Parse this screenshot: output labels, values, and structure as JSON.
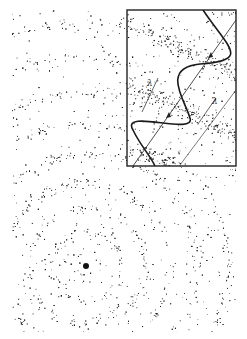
{
  "figure": {
    "background_color": "#ffffff",
    "ink_color": "#1a1a1a",
    "source": {
      "cx": 86,
      "cy": 266,
      "label": ""
    },
    "ring_radii": [
      12,
      34,
      58,
      84,
      112,
      142,
      174,
      208,
      244,
      282
    ],
    "inset": {
      "x": 127,
      "y": 10,
      "width": 109,
      "height": 156,
      "labels": [
        {
          "text": "λ",
          "x": 147,
          "y": 86
        },
        {
          "text": "λ",
          "x": 212,
          "y": 104
        }
      ]
    }
  }
}
